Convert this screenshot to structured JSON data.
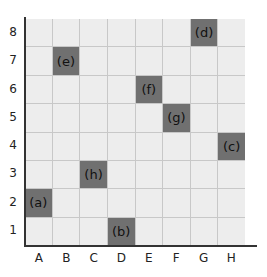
{
  "grid": {
    "columns": [
      "A",
      "B",
      "C",
      "D",
      "E",
      "F",
      "G",
      "H"
    ],
    "rows": [
      "8",
      "7",
      "6",
      "5",
      "4",
      "3",
      "2",
      "1"
    ],
    "colors": {
      "cell": "#ededed",
      "filled": "#707070",
      "gridline": "#c8c8c8",
      "axis": "#333333"
    },
    "marked_cells": [
      {
        "label": "(a)",
        "col": "A",
        "row": "2"
      },
      {
        "label": "(b)",
        "col": "D",
        "row": "1"
      },
      {
        "label": "(c)",
        "col": "H",
        "row": "4"
      },
      {
        "label": "(d)",
        "col": "G",
        "row": "8"
      },
      {
        "label": "(e)",
        "col": "B",
        "row": "7"
      },
      {
        "label": "(f)",
        "col": "E",
        "row": "6"
      },
      {
        "label": "(g)",
        "col": "F",
        "row": "5"
      },
      {
        "label": "(h)",
        "col": "C",
        "row": "3"
      }
    ]
  }
}
